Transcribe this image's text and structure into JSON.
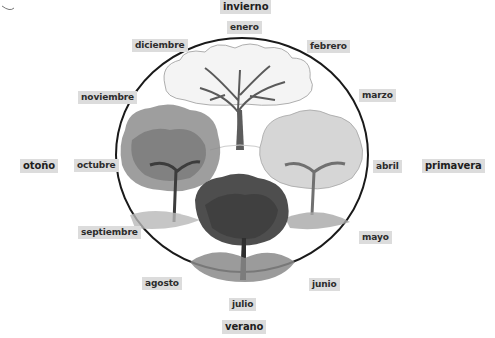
{
  "diagram": {
    "type": "seasonal-cycle",
    "seasons": [
      {
        "key": "winter",
        "label": "invierno"
      },
      {
        "key": "spring",
        "label": "primavera"
      },
      {
        "key": "summer",
        "label": "verano"
      },
      {
        "key": "autumn",
        "label": "otoño"
      }
    ],
    "months": [
      {
        "key": "jan",
        "label": "enero"
      },
      {
        "key": "feb",
        "label": "febrero"
      },
      {
        "key": "mar",
        "label": "marzo"
      },
      {
        "key": "apr",
        "label": "abril"
      },
      {
        "key": "may",
        "label": "mayo"
      },
      {
        "key": "jun",
        "label": "junio"
      },
      {
        "key": "jul",
        "label": "julio"
      },
      {
        "key": "aug",
        "label": "agosto"
      },
      {
        "key": "sep",
        "label": "septiembre"
      },
      {
        "key": "oct",
        "label": "octubre"
      },
      {
        "key": "nov",
        "label": "noviembre"
      },
      {
        "key": "dec",
        "label": "diciembre"
      }
    ],
    "illustrations": [
      {
        "key": "winter-tree",
        "description": "bare tree with snow"
      },
      {
        "key": "spring-tree",
        "description": "tree with light blossoms"
      },
      {
        "key": "summer-tree",
        "description": "tree with dense dark foliage"
      },
      {
        "key": "autumn-tree",
        "description": "tree with mottled leaves"
      }
    ],
    "colors": {
      "label_bg": "#dcdcdc",
      "label_text": "#222222",
      "circle_stroke": "#1a1a1a"
    }
  }
}
